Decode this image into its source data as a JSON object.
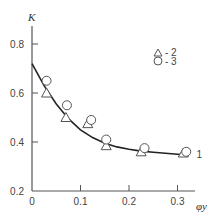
{
  "chart_data": {
    "type": "scatter",
    "title": "",
    "xlabel": "φy",
    "ylabel": "K",
    "xlim": [
      0,
      0.34
    ],
    "ylim": [
      0.2,
      0.86
    ],
    "x_ticks": [
      0,
      0.1,
      0.2,
      0.3
    ],
    "x_tick_labels": [
      "0",
      "0.1",
      "0.2",
      "0.3"
    ],
    "y_ticks": [
      0.2,
      0.4,
      0.6,
      0.8
    ],
    "y_tick_labels": [
      "0.2",
      "0.4",
      "0.6",
      "0.8"
    ],
    "grid": false,
    "legend_position": "upper right",
    "series": [
      {
        "name": "1",
        "kind": "curve",
        "x": [
          0,
          0.025,
          0.05,
          0.075,
          0.1,
          0.125,
          0.15,
          0.175,
          0.2,
          0.225,
          0.25,
          0.275,
          0.3,
          0.32
        ],
        "values": [
          0.72,
          0.63,
          0.555,
          0.495,
          0.45,
          0.418,
          0.395,
          0.38,
          0.37,
          0.363,
          0.358,
          0.354,
          0.35,
          0.347
        ]
      },
      {
        "name": "2",
        "marker": "triangle",
        "x": [
          0.03,
          0.07,
          0.115,
          0.153,
          0.225,
          0.312
        ],
        "values": [
          0.6,
          0.5,
          0.475,
          0.385,
          0.36,
          0.355
        ]
      },
      {
        "name": "3",
        "marker": "circle",
        "x": [
          0.03,
          0.072,
          0.122,
          0.153,
          0.232,
          0.318
        ],
        "values": [
          0.65,
          0.55,
          0.49,
          0.41,
          0.375,
          0.36
        ]
      }
    ],
    "legend": [
      {
        "marker": "triangle",
        "label": "- 2"
      },
      {
        "marker": "circle",
        "label": "- 3"
      }
    ],
    "annotations": [
      {
        "text": "1",
        "x": 0.335,
        "y": 0.35
      }
    ]
  }
}
